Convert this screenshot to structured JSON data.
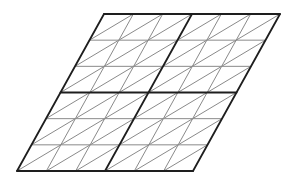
{
  "diagram": {
    "title": "",
    "grid_units": 6,
    "block_units": 3,
    "corners": {
      "top_left": [
        104,
        14
      ],
      "top_right": [
        280,
        14
      ],
      "bottom_right": [
        192,
        171
      ],
      "bottom_left": [
        17,
        171
      ]
    },
    "colors": {
      "thin_line": "#8a8a8a",
      "thick_line": "#1e1e1e",
      "background": "#ffffff"
    }
  }
}
